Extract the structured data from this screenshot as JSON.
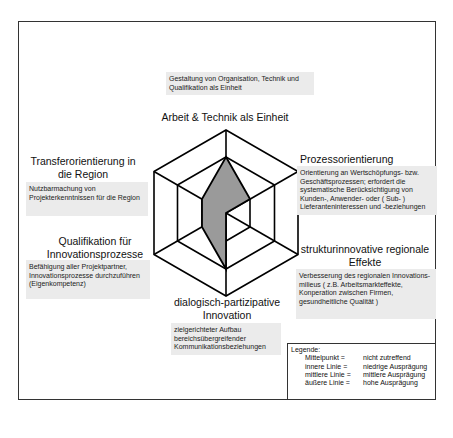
{
  "diagram": {
    "type": "hexagon-radar",
    "axes": [
      {
        "id": "arbeit",
        "title": "Arbeit & Technik als Einheit",
        "description": "Gestaltung von Organisation, Technik und Qualifikation als Einheit",
        "level": 2
      },
      {
        "id": "prozess",
        "title": "Prozessorientierung",
        "description": "Orientierung an Wertschöpfungs- bzw. Geschäftsprozessen; erfordert die systematische Berücksichtigung von Kunden-, Anwender- oder ( Sub- ) Lieferanteninteressen und -beziehungen",
        "level": 1
      },
      {
        "id": "struktur",
        "title": "strukturinnovative regionale Effekte",
        "description": "Verbesserung des regionalen Innovations-milieus ( z.B. Arbeitsmarkteffekte, Konperation zwischen Firmen, gesundheitliche Qualität )",
        "level": 0
      },
      {
        "id": "dialog",
        "title": "dialogisch-partizipative Innovation",
        "description": "zielgerichteter Aufbau bereichsübergreifender Kommunikationsbeziehungen",
        "level": 2
      },
      {
        "id": "qualifikation",
        "title": "Qualifikation für Innovationsprozesse",
        "description": "Befähigung aller Projektpartner, Innovationsprozesse durchzuführen (Eigenkompetenz)",
        "level": 1
      },
      {
        "id": "transfer",
        "title": "Transferorientierung in die Region",
        "description": "Nutzbarmachung von Projekterkenntnissen für die Region",
        "level": 1
      }
    ],
    "fill_color": "#9a9a9a",
    "line_color": "#000000"
  },
  "legend": {
    "title": "Legende:",
    "items": [
      {
        "key": "Mittelpunkt =",
        "value": "nicht zutreffend"
      },
      {
        "key": "innere Linie =",
        "value": "niedrige Ausprägung"
      },
      {
        "key": "mittlere Linie =",
        "value": "mittlere Ausprägung"
      },
      {
        "key": "äußere Linie =",
        "value": "hohe Ausprägung"
      }
    ]
  }
}
